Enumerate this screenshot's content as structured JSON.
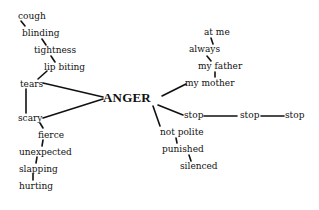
{
  "diagram": {
    "center": {
      "label": "ANGER",
      "x": 103,
      "y": 91
    },
    "colors": {
      "ink": "#111111",
      "background": "#ffffff"
    },
    "left_branch": [
      {
        "id": "cough",
        "label": "cough",
        "x": 18,
        "y": 12
      },
      {
        "id": "blinding",
        "label": "blinding",
        "x": 22,
        "y": 29
      },
      {
        "id": "tightness",
        "label": "tightness",
        "x": 34,
        "y": 46
      },
      {
        "id": "lip_biting",
        "label": "lip biting",
        "x": 44,
        "y": 63
      },
      {
        "id": "tears",
        "label": "tears",
        "x": 20,
        "y": 80
      },
      {
        "id": "scary",
        "label": "scary",
        "x": 18,
        "y": 114
      },
      {
        "id": "fierce",
        "label": "fierce",
        "x": 38,
        "y": 131
      },
      {
        "id": "unexpected",
        "label": "unexpected",
        "x": 19,
        "y": 148
      },
      {
        "id": "slapping",
        "label": "slapping",
        "x": 19,
        "y": 165
      },
      {
        "id": "hurting",
        "label": "hurting",
        "x": 19,
        "y": 182
      }
    ],
    "right_branch": [
      {
        "id": "at_me",
        "label": "at me",
        "x": 204,
        "y": 28
      },
      {
        "id": "always",
        "label": "always",
        "x": 189,
        "y": 45
      },
      {
        "id": "my_father",
        "label": "my father",
        "x": 198,
        "y": 62
      },
      {
        "id": "my_mother",
        "label": "my mother",
        "x": 185,
        "y": 79
      },
      {
        "id": "stop1",
        "label": "stop",
        "x": 184,
        "y": 111
      },
      {
        "id": "stop2",
        "label": "stop",
        "x": 240,
        "y": 111
      },
      {
        "id": "stop3",
        "label": "stop",
        "x": 285,
        "y": 111
      },
      {
        "id": "not_polite",
        "label": "not polite",
        "x": 160,
        "y": 128
      },
      {
        "id": "punished",
        "label": "punished",
        "x": 162,
        "y": 145
      },
      {
        "id": "silenced",
        "label": "silenced",
        "x": 180,
        "y": 162
      }
    ],
    "edges": [
      [
        "cough",
        "blinding"
      ],
      [
        "blinding",
        "tightness"
      ],
      [
        "tightness",
        "lip_biting"
      ],
      [
        "lip_biting",
        "tears"
      ],
      [
        "tears",
        "ANGER"
      ],
      [
        "tears",
        "scary"
      ],
      [
        "scary",
        "ANGER"
      ],
      [
        "scary",
        "fierce"
      ],
      [
        "fierce",
        "unexpected"
      ],
      [
        "unexpected",
        "slapping"
      ],
      [
        "slapping",
        "hurting"
      ],
      [
        "ANGER",
        "my_mother"
      ],
      [
        "my_mother",
        "my_father"
      ],
      [
        "my_father",
        "always"
      ],
      [
        "always",
        "at_me"
      ],
      [
        "ANGER",
        "stop1"
      ],
      [
        "stop1",
        "stop2"
      ],
      [
        "stop2",
        "stop3"
      ],
      [
        "ANGER",
        "not_polite"
      ],
      [
        "not_polite",
        "punished"
      ],
      [
        "punished",
        "silenced"
      ]
    ]
  }
}
